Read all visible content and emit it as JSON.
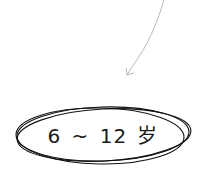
{
  "annotation": {
    "age_range_label": "6 ~ 12 岁",
    "arrow_color": "#a8a8a8",
    "ellipse_color": "#111111",
    "text_color": "#1a1a1a"
  }
}
